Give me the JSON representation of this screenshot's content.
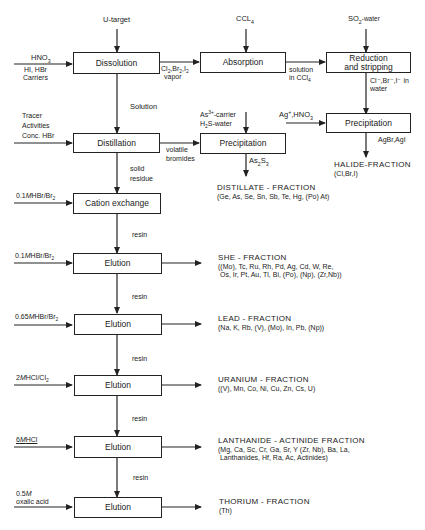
{
  "diagram": {
    "type": "flowchart"
  },
  "boxes": {
    "dissolution": "Dissolution",
    "absorption": "Absorption",
    "reduction_line1": "Reduction",
    "reduction_line2": "and stripping",
    "precipitation_halide": "Precipitation",
    "distillation": "Distillation",
    "precipitation_as": "Precipitation",
    "cation_exchange": "Cation exchange",
    "elution1": "Elution",
    "elution2": "Elution",
    "elution3": "Elution",
    "elution4": "Elution",
    "elution5": "Elution"
  },
  "inputs": {
    "u_target": "U-target",
    "ccl4_top": "CCL",
    "ccl4_sub": "4",
    "so2_main": "SO",
    "so2_sub": "2",
    "so2_rest": "-water",
    "hno3_main": "HNO",
    "hno3_sub": "3",
    "carriers_line1": "HI, HBr",
    "carriers_line2": "Carriers",
    "tracer_line1": "Tracer",
    "tracer_line2": "Activities",
    "tracer_line3": "Conc. HBr",
    "as_carrier_main": "As",
    "as_carrier_sup": "3+",
    "as_carrier_rest": "-carrier",
    "h2s_main": "H",
    "h2s_sub": "2",
    "h2s_rest": "S-water",
    "ag_main": "Ag",
    "ag_sup": "+",
    "ag_rest": ",HNO",
    "ag_sub": "3",
    "cation_eluent_main": "0.1",
    "cation_eluent_m": "M",
    "cation_eluent_rest": "HBr/Br",
    "cation_eluent_sub": "2",
    "elution1_eluent_main": "0.1",
    "elution1_eluent_m": "M",
    "elution1_eluent_rest": "HBr/Br",
    "elution1_eluent_sub": "2",
    "elution2_eluent_main": "0.65",
    "elution2_eluent_m": "M",
    "elution2_eluent_rest": "HBr/Br",
    "elution2_eluent_sub": "2",
    "elution3_eluent_main": "2",
    "elution3_eluent_m": "M",
    "elution3_eluent_rest": "HCl/Cl",
    "elution3_eluent_sub": "2",
    "elution4_eluent_main": "6",
    "elution4_eluent_m": "M",
    "elution4_eluent_rest": "HCl",
    "elution5_eluent_line1_main": "0.5",
    "elution5_eluent_line1_m": "M",
    "elution5_eluent_line2": "oxalic acid"
  },
  "edge_labels": {
    "vapor_line1": "Cl",
    "vapor_sub1": "2",
    "vapor_mid1": ",Br",
    "vapor_sub2": "2",
    "vapor_mid2": ",I",
    "vapor_sub3": "2",
    "vapor_line2": "vapor",
    "solution_ccl4_line1": "solution",
    "solution_ccl4_line2": "in CCl",
    "solution_ccl4_sub": "4",
    "halides_water_line1": "Cl⁻,Br⁻,I⁻ in",
    "halides_water_line2": "water",
    "solution": "Solution",
    "volatile_line1": "volatile",
    "volatile_line2": "bromides",
    "as2s3_main": "As",
    "as2s3_sub1": "2",
    "as2s3_mid": "S",
    "as2s3_sub2": "3",
    "agbr": "AgBr,AgI",
    "solid_line1": "solid",
    "solid_line2": "residue",
    "resin1": "resin",
    "resin2": "resin",
    "resin3": "resin",
    "resin4": "resin",
    "resin5": "resin"
  },
  "fractions": {
    "halide_title": "HALIDE-FRACTION",
    "halide_body": "(Cl,Br,I)",
    "distillate_title": "DISTILLATE - FRACTION",
    "distillate_body": "(Ge, As, Se, Sn, Sb, Te, Hg, (Po) At)",
    "she_title": "SHE - FRACTION",
    "she_body": "((Mo), Tc, Ru, Rh, Pd, Ag, Cd, W, Re,\n Os, Ir, Pt, Au, Tl, Bi, (Po), (Np), (Zr,Nb))",
    "lead_title": "LEAD - FRACTION",
    "lead_body": "(Na, K, Rb, (V), (Mo), In, Pb, (Np))",
    "uranium_title": "URANIUM - FRACTION",
    "uranium_body": "((V), Mn, Co, Ni, Cu, Zn, Cs, U)",
    "lanthanide_title": "LANTHANIDE - ACTINIDE FRACTION",
    "lanthanide_body": "(Mg, Ca, Sc, Cr, Ga, Sr, Y (Zr, Nb), Ba, La,\n Lanthanides, Hf, Ra, Ac, Actinides)",
    "thorium_title": "THORIUM - FRACTION",
    "thorium_body": "(Th)"
  }
}
